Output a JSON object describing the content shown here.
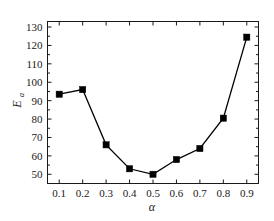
{
  "chart_data": {
    "type": "line",
    "title": "",
    "xlabel": "α",
    "ylabel": "E",
    "ylabel_subscript": "a",
    "x": [
      0.1,
      0.2,
      0.3,
      0.4,
      0.5,
      0.6,
      0.7,
      0.8,
      0.9
    ],
    "values": [
      93.5,
      96.0,
      66.0,
      53.0,
      50.0,
      58.0,
      64.0,
      80.5,
      124.5
    ],
    "xtick_labels": [
      "0.1",
      "0.2",
      "0.3",
      "0.4",
      "0.5",
      "0.6",
      "0.7",
      "0.8",
      "0.9"
    ],
    "ytick_labels": [
      "50",
      "60",
      "70",
      "80",
      "90",
      "100",
      "110",
      "120",
      "130"
    ],
    "ytick_values": [
      50,
      60,
      70,
      80,
      90,
      100,
      110,
      120,
      130
    ],
    "xlim": [
      0.05,
      0.95
    ],
    "ylim": [
      45,
      133
    ],
    "grid": false,
    "legend": null,
    "marker": "filled-square",
    "line_color": "#000000",
    "marker_color": "#000000",
    "background_color": "#ffffff",
    "axis_color": "#1a1a1a"
  }
}
